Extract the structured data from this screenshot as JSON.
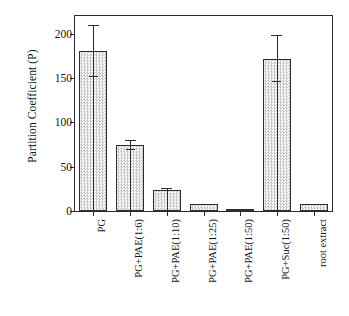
{
  "chart_data": {
    "type": "bar",
    "title": "",
    "subtitle": "",
    "xlabel": "",
    "ylabel": "Partition Coefficient (P)",
    "categories": [
      "PG",
      "PG+PAE(1:6)",
      "PG+PAE(1:10)",
      "PG+PAE(1:25)",
      "PG+PAE(1:50)",
      "PG+Suc(1:50)",
      "root extract"
    ],
    "values": [
      180,
      74,
      24,
      8,
      1,
      171,
      8
    ],
    "errors": [
      29,
      5,
      1,
      0,
      0,
      26,
      0
    ],
    "ylim": [
      0,
      220
    ],
    "yticks": [
      0,
      50,
      100,
      150,
      200
    ],
    "ytick_labels": [
      "0",
      "50",
      "100",
      "150",
      "200"
    ],
    "grid": false,
    "legend": false,
    "legend_position": "none",
    "bar_fill": "#e9e9e9",
    "bar_edge": "#2e2e2e",
    "axis_color": "#2b2b2b"
  }
}
